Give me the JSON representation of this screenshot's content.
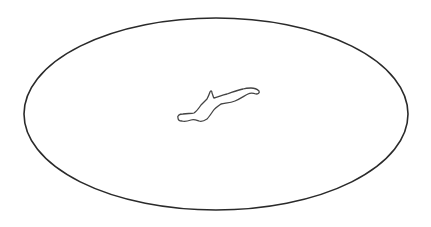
{
  "diagram": {
    "background": "#ffffff",
    "stroke_color": "#2a2a2a",
    "outer_shape": {
      "type": "ellipse",
      "cx": 216,
      "cy": 114,
      "rx": 192,
      "ry": 96
    },
    "inner_shape": {
      "type": "irregular-blob",
      "description": "small elongated island-like outline at center"
    }
  }
}
